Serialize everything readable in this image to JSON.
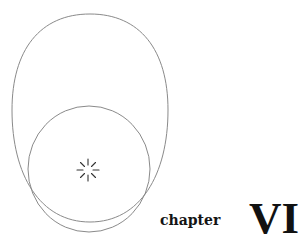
{
  "page": {
    "type": "chapter-opener",
    "chapter_label": "chapter",
    "chapter_number": "VI",
    "illustration": {
      "description": "Line drawing of an egg-shaped oval enclosing a circle near its bottom, with a small starburst at the circle's center",
      "icons": [
        "oval-outline",
        "circle-outline",
        "starburst-icon"
      ],
      "stroke_color": "#8a8a8a",
      "star_color": "#333333"
    },
    "colors": {
      "background": "#ffffff",
      "text": "#111111"
    }
  }
}
